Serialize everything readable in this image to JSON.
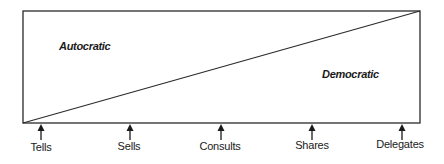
{
  "diagram": {
    "regions": {
      "autocratic": "Autocratic",
      "democratic": "Democratic"
    },
    "continuum": [
      {
        "label": "Tells",
        "x": 41
      },
      {
        "label": "Sells",
        "x": 130
      },
      {
        "label": "Consults",
        "x": 221
      },
      {
        "label": "Shares",
        "x": 312
      },
      {
        "label": "Delegates",
        "x": 402
      }
    ],
    "colors": {
      "line": "#2a2a2a",
      "text": "#1a1a1a",
      "background": "#ffffff"
    }
  }
}
